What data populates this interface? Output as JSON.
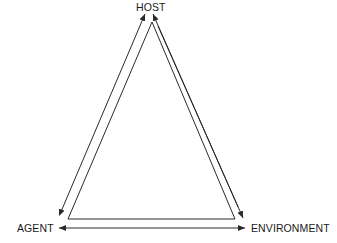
{
  "diagram": {
    "nodes": {
      "host": "HOST",
      "agent": "AGENT",
      "environment": "ENVIRONMENT"
    },
    "edges": [
      {
        "from": "agent",
        "to": "host",
        "style": "arrow"
      },
      {
        "from": "host",
        "to": "environment",
        "style": "arrow"
      },
      {
        "from": "environment",
        "to": "agent",
        "style": "double-arrow"
      }
    ],
    "colors": {
      "line": "#2a2a2a",
      "text": "#1a1a1a",
      "background": "#ffffff"
    }
  }
}
